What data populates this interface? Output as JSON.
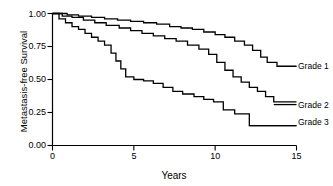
{
  "chart_data": {
    "type": "line",
    "title": "",
    "subtitle": "",
    "xlabel": "Years",
    "ylabel": "Metastasis-free Survival",
    "xlim": [
      0,
      15
    ],
    "ylim": [
      0.0,
      1.0
    ],
    "xticks": [
      0,
      5,
      10,
      15
    ],
    "xtick_labels": [
      "0",
      "5",
      "10",
      "15"
    ],
    "yticks": [
      0.0,
      0.25,
      0.5,
      0.75,
      1.0
    ],
    "ytick_labels": [
      "0.00",
      "0.25",
      "0.50",
      "0.75",
      "1.00"
    ],
    "grid": false,
    "legend_position": "right-inline-labels",
    "plot_style": "kaplan-meier step curves, black lines, no confidence bands",
    "annotations": [
      {
        "text": "Grade 1",
        "x": 15.0,
        "y": 0.6
      },
      {
        "text": "Grade 2",
        "x": 15.0,
        "y": 0.31
      },
      {
        "text": "Grade 3",
        "x": 15.0,
        "y": 0.15
      }
    ],
    "series": [
      {
        "name": "Grade 1",
        "color": "#000000",
        "x": [
          0.0,
          0.9,
          1.6,
          2.4,
          3.2,
          4.0,
          4.8,
          5.6,
          6.4,
          7.2,
          7.9,
          8.6,
          9.3,
          10.0,
          10.6,
          11.2,
          11.8,
          12.3,
          12.8,
          13.2,
          13.8,
          15.0
        ],
        "values": [
          1.0,
          0.99,
          0.98,
          0.97,
          0.96,
          0.95,
          0.94,
          0.93,
          0.92,
          0.9,
          0.89,
          0.88,
          0.86,
          0.84,
          0.82,
          0.79,
          0.76,
          0.72,
          0.67,
          0.63,
          0.6,
          0.6
        ]
      },
      {
        "name": "Grade 2",
        "color": "#000000",
        "x": [
          0.0,
          0.6,
          1.2,
          1.9,
          2.6,
          3.3,
          4.1,
          4.8,
          5.5,
          6.2,
          6.9,
          7.6,
          8.3,
          9.0,
          9.6,
          10.1,
          10.6,
          11.1,
          11.6,
          12.1,
          12.6,
          13.1,
          13.6,
          15.0
        ],
        "values": [
          1.0,
          0.98,
          0.97,
          0.95,
          0.93,
          0.91,
          0.89,
          0.87,
          0.85,
          0.83,
          0.81,
          0.79,
          0.76,
          0.73,
          0.69,
          0.63,
          0.57,
          0.52,
          0.48,
          0.44,
          0.41,
          0.37,
          0.33,
          0.33
        ]
      },
      {
        "name": "Grade 3",
        "color": "#000000",
        "x": [
          0.0,
          0.4,
          0.8,
          1.2,
          1.6,
          2.0,
          2.4,
          2.8,
          3.2,
          3.6,
          3.9,
          4.2,
          4.5,
          5.0,
          5.6,
          6.2,
          6.8,
          7.4,
          8.0,
          8.7,
          9.3,
          9.9,
          10.5,
          11.2,
          12.1,
          15.0
        ],
        "values": [
          1.0,
          0.96,
          0.93,
          0.9,
          0.88,
          0.85,
          0.82,
          0.79,
          0.76,
          0.7,
          0.64,
          0.58,
          0.52,
          0.5,
          0.49,
          0.47,
          0.44,
          0.41,
          0.39,
          0.37,
          0.35,
          0.33,
          0.27,
          0.24,
          0.15,
          0.15
        ]
      }
    ]
  },
  "axis": {
    "ylabel": "Metastasis-free Survival",
    "xlabel": "Years",
    "ytick_0": "1.00",
    "ytick_1": "0.75",
    "ytick_2": "0.50",
    "ytick_3": "0.25",
    "ytick_4": "0.00",
    "xtick_0": "0",
    "xtick_1": "5",
    "xtick_2": "10",
    "xtick_3": "15"
  },
  "labels": {
    "grade1": "Grade 1",
    "grade2": "Grade 2",
    "grade3": "Grade 3"
  },
  "colors": {
    "line": "#000000",
    "axis": "#000000",
    "background": "#ffffff"
  }
}
